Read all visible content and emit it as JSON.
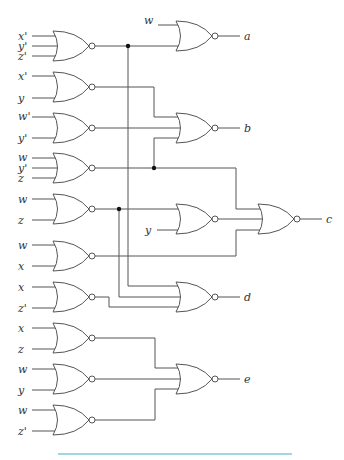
{
  "diagram": {
    "type": "logic-circuit",
    "gate_type": "NOR",
    "input_gates": [
      {
        "id": "g1",
        "inputs": [
          "x'",
          "y'",
          "z'"
        ]
      },
      {
        "id": "g2",
        "inputs": [
          "x'",
          "y"
        ]
      },
      {
        "id": "g3",
        "inputs": [
          "w'",
          "y'"
        ]
      },
      {
        "id": "g4",
        "inputs": [
          "w",
          "y'",
          "z"
        ]
      },
      {
        "id": "g5",
        "inputs": [
          "w",
          "z"
        ]
      },
      {
        "id": "g6",
        "inputs": [
          "w",
          "x"
        ]
      },
      {
        "id": "g7",
        "inputs": [
          "x",
          "z'"
        ]
      },
      {
        "id": "g8",
        "inputs": [
          "x",
          "z"
        ]
      },
      {
        "id": "g9",
        "inputs": [
          "w",
          "y"
        ]
      },
      {
        "id": "g10",
        "inputs": [
          "w",
          "z'"
        ]
      }
    ],
    "intermediate_gates": [
      {
        "id": "m1",
        "inputs": [
          "g5",
          "y"
        ]
      }
    ],
    "outputs": [
      {
        "id": "a",
        "label": "a",
        "inputs": [
          "w",
          "g1"
        ]
      },
      {
        "id": "b",
        "label": "b",
        "inputs": [
          "g2",
          "g3",
          "g4"
        ]
      },
      {
        "id": "c",
        "label": "c",
        "inputs": [
          "g4",
          "m1",
          "g6"
        ]
      },
      {
        "id": "d",
        "label": "d",
        "inputs": [
          "g1",
          "g5",
          "g7"
        ]
      },
      {
        "id": "e",
        "label": "e",
        "inputs": [
          "g8",
          "g9",
          "g10"
        ]
      }
    ],
    "extra_labels": {
      "a_input_w": "w",
      "m1_input_y": "y"
    },
    "accent_rule_color": "#7ec8d8"
  }
}
